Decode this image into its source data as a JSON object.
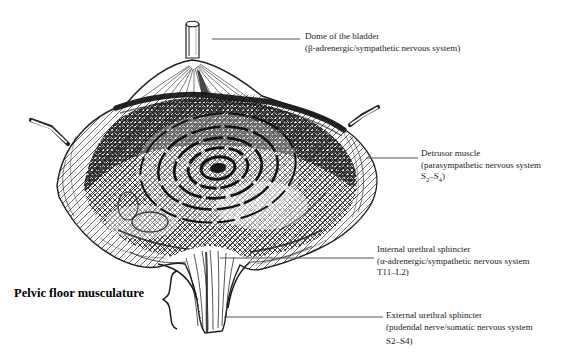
{
  "figure": {
    "background_color": "#ffffff",
    "ink_color": "#1a1a1a",
    "leader_line_color": "#555555"
  },
  "labels": {
    "dome": {
      "line1": "Dome of the bladder",
      "line2": "(β-adrenergic/sympathetic nervous system)"
    },
    "detrusor": {
      "line1": "Detrusor muscle",
      "line2": "(parasympathetic nervous system",
      "line3_pre": "S",
      "line3_sub1": "2",
      "line3_dash": "–S",
      "line3_sub2": "4",
      "line3_post": ")"
    },
    "internal_sphincter": {
      "line1": "Internal urethral sphincter",
      "line2": "(α-adrenergic/sympathetic nervous system",
      "line3": "T11–L2)"
    },
    "pelvic_floor": {
      "label": "Pelvic floor musculature"
    },
    "external_sphincter": {
      "line1": "External urethral sphincter",
      "line2": "(pudendal nerve/somatic nervous system",
      "line3": "S2–S4)"
    }
  }
}
